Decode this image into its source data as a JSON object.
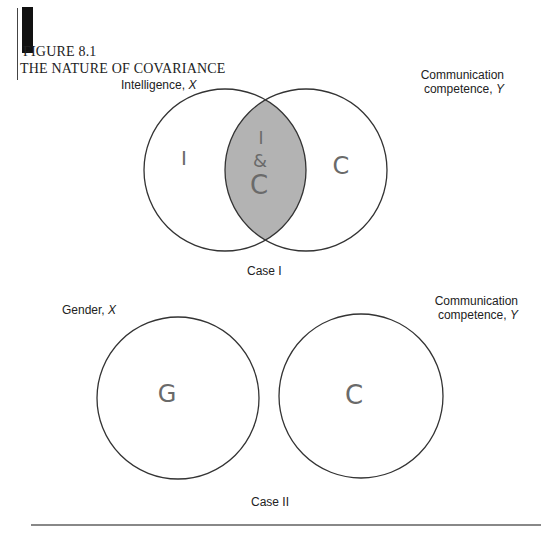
{
  "figure": {
    "number": "FIGURE 8.1",
    "title": "THE NATURE OF COVARIANCE"
  },
  "case1": {
    "caption": "Case I",
    "left_label": {
      "text": "Intelligence,",
      "var": "X"
    },
    "right_label": {
      "line1": "Communication",
      "line2": "competence,",
      "var": "Y"
    },
    "left_circle_mark": "I",
    "right_circle_mark": "C",
    "overlap_mark": {
      "line1": "I",
      "line2": "&",
      "line3": "C"
    },
    "overlap_fill": "#b3b3b3"
  },
  "case2": {
    "caption": "Case II",
    "left_label": {
      "text": "Gender,",
      "var": "X"
    },
    "right_label": {
      "line1": "Communication",
      "line2": "competence,",
      "var": "Y"
    },
    "left_circle_mark": "G",
    "right_circle_mark": "C"
  },
  "colors": {
    "stroke": "#333333",
    "handwriting": "#6a6a6a",
    "overlap": "#b3b3b3"
  }
}
